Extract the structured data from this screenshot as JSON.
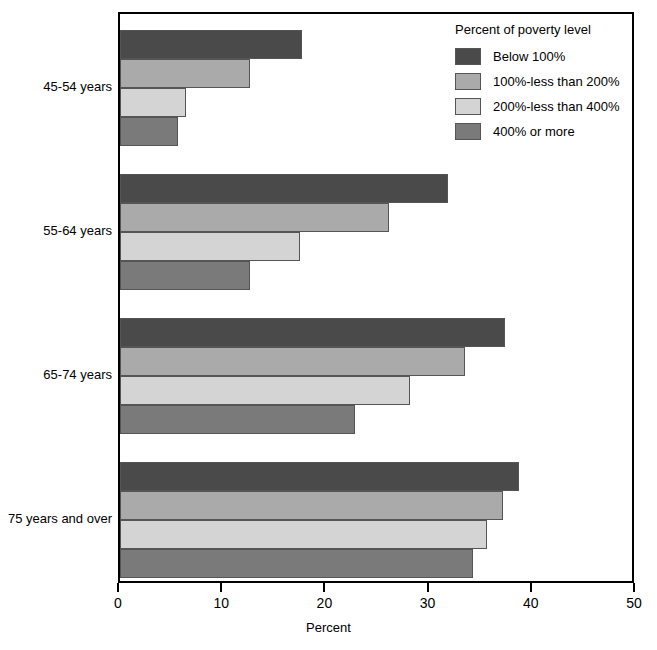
{
  "chart_data": {
    "type": "bar",
    "orientation": "horizontal",
    "title": "",
    "xlabel": "Percent",
    "ylabel": "",
    "xlim": [
      0,
      50
    ],
    "xticks": [
      0,
      10,
      20,
      30,
      40,
      50
    ],
    "grid": false,
    "legend_position": "top-right",
    "legend_title": "Percent of poverty level",
    "categories": [
      "45-54 years",
      "55-64 years",
      "65-74 years",
      "75 years and over"
    ],
    "series": [
      {
        "name": "Below 100%",
        "color": "#4a4a4a",
        "values": [
          17.6,
          31.8,
          37.3,
          38.7
        ]
      },
      {
        "name": "100%-less than 200%",
        "color": "#aaaaaa",
        "values": [
          12.6,
          26.1,
          33.4,
          37.1
        ]
      },
      {
        "name": "200%-less than 400%",
        "color": "#d4d4d4",
        "values": [
          6.4,
          17.4,
          28.1,
          35.6
        ]
      },
      {
        "name": "400% or more",
        "color": "#7a7a7a",
        "values": [
          5.6,
          12.6,
          22.8,
          34.2
        ]
      }
    ]
  },
  "axis": {
    "tick_labels": [
      "0",
      "10",
      "20",
      "30",
      "40",
      "50"
    ],
    "title": "Percent"
  },
  "legend": {
    "title": "Percent of poverty level",
    "items": [
      {
        "label": "Below 100%",
        "color": "#4a4a4a"
      },
      {
        "label": "100%-less than 200%",
        "color": "#aaaaaa"
      },
      {
        "label": "200%-less than 400%",
        "color": "#d4d4d4"
      },
      {
        "label": "400% or more",
        "color": "#7a7a7a"
      }
    ]
  },
  "categories": [
    {
      "label": "45-54 years"
    },
    {
      "label": "55-64 years"
    },
    {
      "label": "65-74 years"
    },
    {
      "label": "75 years and over"
    }
  ]
}
